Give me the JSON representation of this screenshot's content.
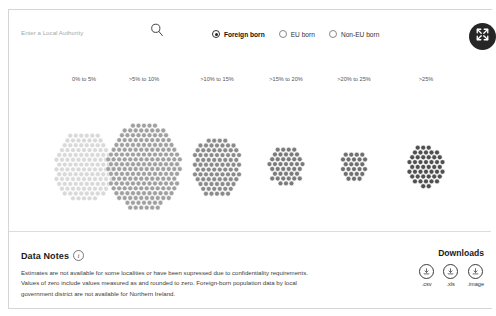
{
  "search": {
    "placeholder": "Enter a Local Authority",
    "value": "",
    "icon": "search-icon"
  },
  "fullscreen": {
    "icon": "fullscreen-expand-icon"
  },
  "filters": {
    "options": [
      {
        "label": "Foreign born",
        "selected": true
      },
      {
        "label": "EU born",
        "selected": false
      },
      {
        "label": "Non-EU born",
        "selected": false
      }
    ]
  },
  "data_notes": {
    "title": "Data Notes",
    "info_icon": "info-icon",
    "body": "Estimates are not available for some localities or have been supressed due to confidentiality requirements. Values of zero include values measured as and rounded to zero. Foreign-born population data by local government district are not available for Northern Ireland."
  },
  "downloads": {
    "title": "Downloads",
    "items": [
      {
        "label": ".csv",
        "icon": "download-icon"
      },
      {
        "label": ".xls",
        "icon": "download-icon"
      },
      {
        "label": ".image",
        "icon": "download-icon"
      }
    ]
  },
  "chart_data": {
    "type": "bar",
    "variant": "dot-cluster",
    "title": "",
    "xlabel": "",
    "ylabel": "",
    "unit": "local authorities",
    "dot_meaning": "one dot = one local authority",
    "categories": [
      "0% to 5%",
      ">5% to 10%",
      ">10% to 15%",
      ">15% to 20%",
      ">20% to 25%",
      ">25%"
    ],
    "values": [
      126,
      196,
      88,
      44,
      25,
      47
    ],
    "colors": [
      "#d9d9d9",
      "#a0a0a0",
      "#8a8a8a",
      "#7a7a7a",
      "#6e6e6e",
      "#4f4f4f"
    ],
    "legend_position": "top",
    "grid": false
  }
}
